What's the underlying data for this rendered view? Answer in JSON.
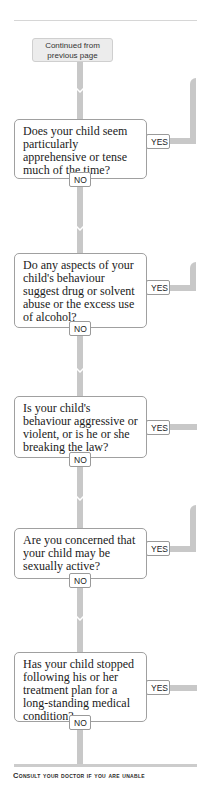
{
  "start": {
    "label": "Continued from previous page"
  },
  "questions": [
    {
      "text": "Does your child seem particularly apprehensive or tense much of the time?",
      "yes": "YES",
      "no": "NO"
    },
    {
      "text": "Do any aspects of your child's behaviour suggest drug or solvent abuse or the excess use of alcohol?",
      "yes": "YES",
      "no": "NO"
    },
    {
      "text": "Is your child's behaviour aggressive or violent, or is he or she breaking the law?",
      "yes": "YES",
      "no": "NO"
    },
    {
      "text": "Are you concerned that your child may be sexually active?",
      "yes": "YES",
      "no": "NO"
    },
    {
      "text": "Has your child stopped following his or her treatment plan for a long-standing medical condition?",
      "yes": "YES",
      "no": "NO"
    }
  ],
  "footer": {
    "text": "Consult your doctor if you are unable"
  },
  "colors": {
    "connector": "#c8c8c8",
    "box_border": "#a0a0a0",
    "start_fill": "#ececec"
  }
}
